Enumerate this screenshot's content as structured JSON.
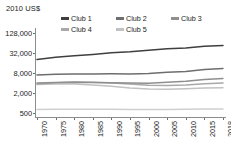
{
  "chart_data": {
    "type": "line",
    "title": "",
    "ylabel": "2010 US$",
    "xlabel": "",
    "yscale": "log",
    "ylim": [
      500,
      128000
    ],
    "yticks": [
      500,
      2000,
      8000,
      32000,
      128000
    ],
    "ytick_labels": [
      "500",
      "2,000",
      "8,000",
      "32,000",
      "128,000"
    ],
    "x": [
      1970,
      1975,
      1980,
      1985,
      1990,
      1995,
      2000,
      2005,
      2010,
      2015,
      2018
    ],
    "xtick_labels": [
      "1970",
      "1975",
      "1980",
      "1985",
      "1990",
      "1995",
      "2000",
      "2005",
      "2010",
      "2015",
      "2018"
    ],
    "grid": false,
    "legend_position": "top",
    "series": [
      {
        "name": "Club 1",
        "color": "#3f3f3f",
        "values": [
          20500,
          24000,
          26500,
          29000,
          32500,
          35000,
          39000,
          43000,
          45500,
          51000,
          54000
        ]
      },
      {
        "name": "Club 2",
        "color": "#6e6e6e",
        "values": [
          7000,
          7300,
          7500,
          7500,
          7600,
          7500,
          7700,
          8400,
          8900,
          10200,
          11000
        ]
      },
      {
        "name": "Club 3",
        "color": "#8f8f8f",
        "values": [
          4000,
          4150,
          4250,
          4150,
          4100,
          4000,
          3950,
          4200,
          4500,
          5100,
          5500
        ]
      },
      {
        "name": "Club 4",
        "color": "#a8a8a8",
        "values": [
          3700,
          4100,
          4300,
          4200,
          4000,
          3700,
          3400,
          3350,
          3500,
          3800,
          4000
        ]
      },
      {
        "name": "Club 5",
        "color": "#c2c2c2",
        "values": [
          3600,
          3700,
          3700,
          3500,
          3200,
          2850,
          2650,
          2600,
          2700,
          2850,
          2900
        ]
      }
    ],
    "flat_baseline_series": {
      "name": "baseline",
      "color": "#cfcfcf",
      "values": [
        640,
        645,
        650,
        648,
        645,
        640,
        638,
        640,
        650,
        660,
        665
      ]
    }
  },
  "legend": {
    "items": [
      {
        "label": "Club 1"
      },
      {
        "label": "Club 2"
      },
      {
        "label": "Club 3"
      },
      {
        "label": "Club 4"
      },
      {
        "label": "Club 5"
      }
    ]
  }
}
